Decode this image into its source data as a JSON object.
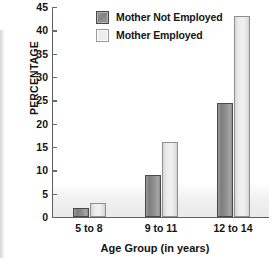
{
  "chart_data": {
    "type": "bar",
    "title": "",
    "categories": [
      "5 to 8",
      "9 to 11",
      "12 to 14"
    ],
    "series": [
      {
        "name": "Mother Not Employed",
        "values": [
          2,
          9,
          24.5
        ],
        "color": "#8d8d8d"
      },
      {
        "name": "Mother Employed",
        "values": [
          3,
          16,
          43
        ],
        "color": "#ededed"
      }
    ],
    "xlabel": "Age Group (in years)",
    "ylabel": "PERCENTAGE",
    "ylim": [
      0,
      45
    ],
    "yticks": [
      0,
      5,
      10,
      15,
      20,
      25,
      30,
      35,
      40,
      45
    ],
    "grid": false,
    "legend_position": "top-center"
  },
  "axes": {
    "y_title": "PERCENTAGE",
    "x_title": "Age Group (in years)",
    "y_tick_labels": [
      "45",
      "40",
      "35",
      "30",
      "25",
      "20",
      "15",
      "10",
      "5",
      "0"
    ],
    "x_tick_labels": [
      "5 to 8",
      "9 to 11",
      "12 to 14"
    ]
  },
  "legend": {
    "items": [
      {
        "label": "Mother Not Employed",
        "swatch": "dark"
      },
      {
        "label": "Mother Employed",
        "swatch": "light"
      }
    ]
  },
  "colors": {
    "bar_dark": "#8d8d8d",
    "bar_dark_border": "#4a4a4a",
    "bar_light": "#ededed",
    "bar_light_border": "#8f8f8f",
    "axis": "#5e5e5e",
    "text": "#141414",
    "background": "#ffffff"
  }
}
